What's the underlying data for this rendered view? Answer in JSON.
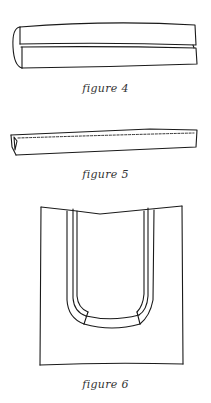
{
  "figures": [
    {
      "id": "figure-4",
      "caption": "figure 4",
      "depicts": "fabric strip folded lengthwise with edges meeting at center"
    },
    {
      "id": "figure-5",
      "caption": "figure 5",
      "depicts": "folded strip stitched along the edge (dashed stitch line)"
    },
    {
      "id": "figure-6",
      "caption": "figure 6",
      "depicts": "tote bag with two attached strap handles"
    }
  ],
  "colors": {
    "ink": "#1a1a1a",
    "background": "#ffffff",
    "caption": "#333333"
  }
}
